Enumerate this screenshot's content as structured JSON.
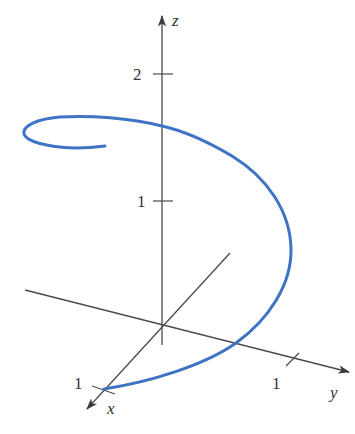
{
  "figure": {
    "type": "3d-space-curve"
  },
  "colors": {
    "axis": "#4a4a4a",
    "curve": "#3f74c4",
    "background": "#ffffff"
  },
  "axes": {
    "x": {
      "label": "x",
      "tick_label": "1"
    },
    "y": {
      "label": "y",
      "tick_label": "1"
    },
    "z": {
      "label": "z",
      "tick_labels": [
        "2",
        "1"
      ]
    }
  }
}
